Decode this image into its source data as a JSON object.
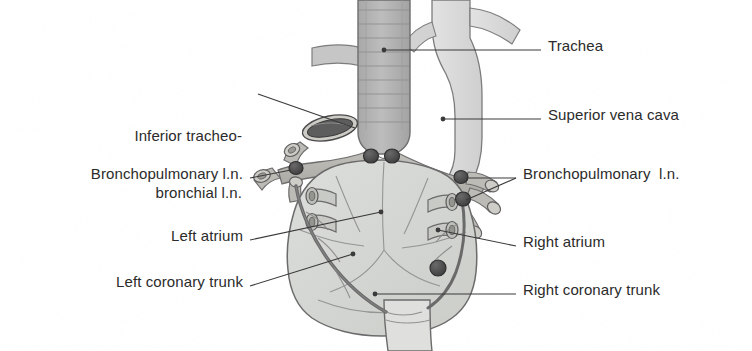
{
  "figure": {
    "type": "anatomical-illustration",
    "background_color": "#ffffff",
    "label_color": "#2b2b2b",
    "leader_line_color": "#3a3a3a",
    "palette": {
      "trachea_fill": "#b3b3b3",
      "trachea_outline": "#6e6e6e",
      "vessel_light_fill": "#d9d9d9",
      "vessel_outline": "#7a7a7a",
      "heart_fill": "#d5d7d4",
      "heart_outline": "#6b6b6b",
      "bronchus_fill": "#b9b7b2",
      "lymph_node_fill": "#4a4a4a",
      "coronary_vessel": "#6a6a6a"
    }
  },
  "labels": {
    "trachea": {
      "text": "Trachea",
      "side": "right",
      "x": 548,
      "y": 44
    },
    "superior_vena_cava": {
      "text": "Superior vena cava",
      "side": "right",
      "x": 548,
      "y": 113
    },
    "inferior_tracheobronchial": {
      "line1": "Inferior tracheo-",
      "line2": "bronchial l.n.",
      "side": "left",
      "x": 252,
      "y": 88
    },
    "bronchopulmonary_left": {
      "text": "Bronchopulmonary l.n.",
      "side": "left",
      "x": 243,
      "y": 172
    },
    "bronchopulmonary_right": {
      "text": "Bronchopulmonary  l.n.",
      "side": "right",
      "x": 523,
      "y": 172
    },
    "left_atrium": {
      "text": "Left atrium",
      "side": "left",
      "x": 243,
      "y": 234
    },
    "right_atrium": {
      "text": "Right atrium",
      "side": "right",
      "x": 523,
      "y": 240
    },
    "left_coronary_trunk": {
      "text": "Left coronary trunk",
      "side": "left",
      "x": 243,
      "y": 280
    },
    "right_coronary_trunk": {
      "text": "Right coronary trunk",
      "side": "right",
      "x": 523,
      "y": 288
    }
  },
  "structures": [
    {
      "name": "trachea",
      "description": "Vertical airway with cartilage rings, cropped at top edge"
    },
    {
      "name": "superior-vena-cava",
      "description": "Large light vessel descending on the right"
    },
    {
      "name": "left-main-bronchus",
      "description": "Branching airway to the left lung"
    },
    {
      "name": "right-main-bronchus",
      "description": "Branching airway to the right lung"
    },
    {
      "name": "left-atrium",
      "description": "Posterior heart chamber with pulmonary vein openings"
    },
    {
      "name": "right-atrium",
      "description": "Right posterior heart chamber"
    },
    {
      "name": "left-coronary-trunk",
      "description": "Coronary vessel crossing the posterior heart"
    },
    {
      "name": "right-coronary-trunk",
      "description": "Coronary vessel along the right heart border"
    },
    {
      "name": "inferior-tracheobronchial-node",
      "description": "Dark elliptical lymph node below the tracheal bifurcation"
    },
    {
      "name": "bronchopulmonary-nodes",
      "description": "Dark lymph nodes clustered at the bronchial hila"
    },
    {
      "name": "pulmonary-veins",
      "description": "Tubular openings entering the left atrium"
    },
    {
      "name": "inferior-vena-cava",
      "description": "Short vessel stump at the bottom of the heart"
    }
  ]
}
